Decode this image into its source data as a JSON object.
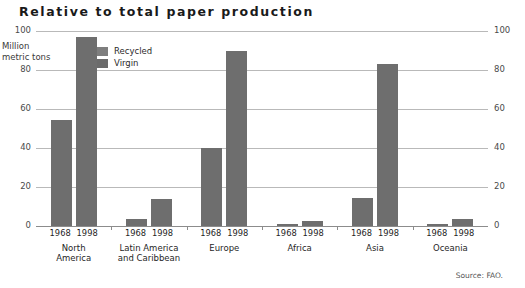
{
  "title": "Relative to total paper production",
  "axis_unit": "Million\nmetric tons",
  "legend": {
    "items": [
      {
        "label": "Recycled",
        "color": "#7e7e7e"
      },
      {
        "label": "Virgin",
        "color": "#6b6b6b"
      }
    ]
  },
  "source": "Source: FAO.",
  "colors": {
    "bar": "#6e6e6e",
    "grid": "#b9b9b9",
    "text": "#1f1f1f"
  },
  "chart_data": {
    "type": "bar",
    "title": "Relative to total paper production",
    "xlabel": "",
    "ylabel": "Million metric tons",
    "ylim": [
      0,
      100
    ],
    "yticks": [
      0,
      20,
      40,
      60,
      80,
      100
    ],
    "ytick_labels": [
      "0",
      "20",
      "40",
      "60",
      "80",
      "100"
    ],
    "right_axis": true,
    "right_ytick_labels": [
      "0",
      "20",
      "40",
      "60",
      "80",
      "100"
    ],
    "grid": true,
    "legend_position": "inside-upper-left",
    "legend_entries": [
      "Recycled",
      "Virgin"
    ],
    "categories": [
      "North America",
      "Latin America and Caribbean",
      "Europe",
      "Africa",
      "Asia",
      "Oceania"
    ],
    "sub_categories": [
      "1968",
      "1998"
    ],
    "series": [
      {
        "name": "1968",
        "values": [
          54.5,
          3.5,
          40,
          1,
          14.5,
          1
        ]
      },
      {
        "name": "1998",
        "values": [
          97,
          14,
          90,
          2.5,
          83,
          3.5
        ]
      }
    ],
    "annotations": [
      "Source: FAO."
    ]
  },
  "categories": [
    {
      "name": "North\nAmerica",
      "years": [
        "1968",
        "1998"
      ],
      "values": [
        54.5,
        97
      ]
    },
    {
      "name": "Latin America\nand Caribbean",
      "years": [
        "1968",
        "1998"
      ],
      "values": [
        3.5,
        14
      ]
    },
    {
      "name": "Europe",
      "years": [
        "1968",
        "1998"
      ],
      "values": [
        40,
        90
      ]
    },
    {
      "name": "Africa",
      "years": [
        "1968",
        "1998"
      ],
      "values": [
        1,
        2.5
      ]
    },
    {
      "name": "Asia",
      "years": [
        "1968",
        "1998"
      ],
      "values": [
        14.5,
        83
      ]
    },
    {
      "name": "Oceania",
      "years": [
        "1968",
        "1998"
      ],
      "values": [
        1,
        3.5
      ]
    }
  ],
  "yticks": [
    {
      "value": 100,
      "label": "100"
    },
    {
      "value": 80,
      "label": "80"
    },
    {
      "value": 60,
      "label": "60"
    },
    {
      "value": 40,
      "label": "40"
    },
    {
      "value": 20,
      "label": "20"
    },
    {
      "value": 0,
      "label": "0"
    }
  ]
}
